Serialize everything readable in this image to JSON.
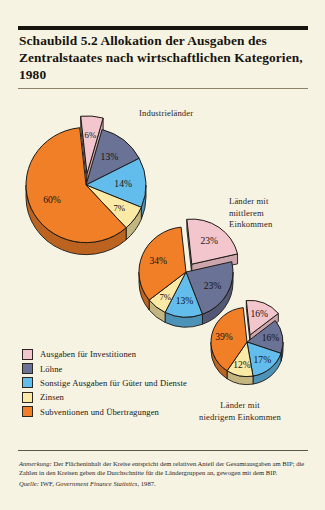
{
  "figure": {
    "title": "Schaubild 5.2  Allokation der Ausgaben des Zentralstaates nach wirtschaftlichen Kategorien, 1980",
    "note_label": "Anmerkung:",
    "note_text": " Der Flächeninhalt der Kreise entspricht dem relativen Anteil der Gesamtausgaben am BIP; die Zahlen in den Kreisen geben die Durchschnitte für die Ländergruppen an, gewogen mit dem BIP.",
    "source_label": "Quelle:",
    "source_text": " IWF, ",
    "source_italic": "Government Finance Statistics",
    "source_year": ", 1987."
  },
  "legend": {
    "items": [
      {
        "label": "Ausgaben für Investitionen",
        "color": "#f3c6cd"
      },
      {
        "label": "Löhne",
        "color": "#6a7296"
      },
      {
        "label": "Sonstige Ausgaben für Güter und Dienste",
        "color": "#63bdec"
      },
      {
        "label": "Zinsen",
        "color": "#fbe9a6"
      },
      {
        "label": "Subventionen und Übertragungen",
        "color": "#f07f28"
      }
    ]
  },
  "chart_data": {
    "type": "pie",
    "title": "Schaubild 5.2  Allokation der Ausgaben des Zentralstaates nach wirtschaftlichen Kategorien, 1980",
    "categories": [
      "Ausgaben für Investitionen",
      "Löhne",
      "Sonstige Ausgaben für Güter und Dienste",
      "Zinsen",
      "Subventionen und Übertragungen"
    ],
    "colors": [
      "#f3c6cd",
      "#6a7296",
      "#63bdec",
      "#fbe9a6",
      "#f07f28"
    ],
    "unit": "%",
    "exploded_slice": "Ausgaben für Investitionen",
    "legend_position": "bottom-left",
    "pies": [
      {
        "name": "Industrieländer",
        "label_lines": [
          "Industrieländer"
        ],
        "values": [
          6,
          13,
          14,
          7,
          60
        ],
        "labels": [
          "6%",
          "13%",
          "14%",
          "7%",
          "60%"
        ]
      },
      {
        "name": "Länder mit mittlerem Einkommen",
        "label_lines": [
          "Länder mit",
          "mittlerem",
          "Einkommen"
        ],
        "values": [
          23,
          23,
          13,
          7,
          34
        ],
        "labels": [
          "23%",
          "23%",
          "13%",
          "7%",
          "34%"
        ]
      },
      {
        "name": "Länder mit niedrigem Einkommen",
        "label_lines": [
          "Länder mit",
          "niedrigem Einkommen"
        ],
        "values": [
          16,
          16,
          17,
          12,
          39
        ],
        "labels": [
          "16%",
          "16%",
          "17%",
          "12%",
          "39%"
        ]
      }
    ]
  }
}
